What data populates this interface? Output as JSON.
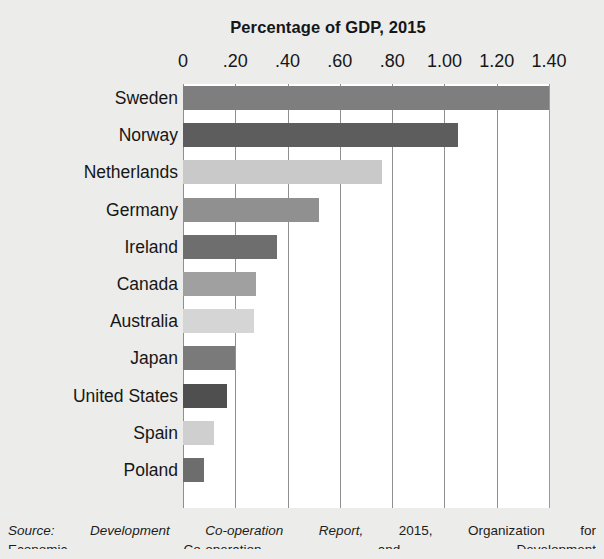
{
  "chart_data": {
    "type": "bar",
    "orientation": "horizontal",
    "title": "Percentage of GDP, 2015",
    "xlabel": "",
    "ylabel": "",
    "xlim": [
      0,
      1.4
    ],
    "xticks": [
      0,
      0.2,
      0.4,
      0.6,
      0.8,
      1.0,
      1.2,
      1.4
    ],
    "xtick_labels": [
      "0",
      ".20",
      ".40",
      ".60",
      ".80",
      "1.00",
      "1.20",
      "1.40"
    ],
    "grid": true,
    "legend": "none",
    "categories": [
      "Sweden",
      "Norway",
      "Netherlands",
      "Germany",
      "Ireland",
      "Canada",
      "Australia",
      "Japan",
      "United States",
      "Spain",
      "Poland"
    ],
    "values": [
      1.4,
      1.05,
      0.76,
      0.52,
      0.36,
      0.28,
      0.27,
      0.2,
      0.17,
      0.12,
      0.08
    ],
    "bar_colors": [
      "#7e7e7e",
      "#5d5d5d",
      "#c9c9c9",
      "#909090",
      "#6e6e6e",
      "#a0a0a0",
      "#d5d5d5",
      "#7a7a7a",
      "#4f4f4f",
      "#cfcfcf",
      "#6d6d6d"
    ]
  },
  "source": {
    "line1": "Source: Development Co-operation Report, 2015, Organization for",
    "line1_cite": "Source: Development Co-operation Report,",
    "line1_rest": "2015, Organization for",
    "line2": "Economic Co-operation and Development"
  },
  "colors": {
    "page_background": "#ececeb",
    "plot_background": "#ffffff",
    "gridline": "#8f8f8f",
    "text": "#161616"
  }
}
